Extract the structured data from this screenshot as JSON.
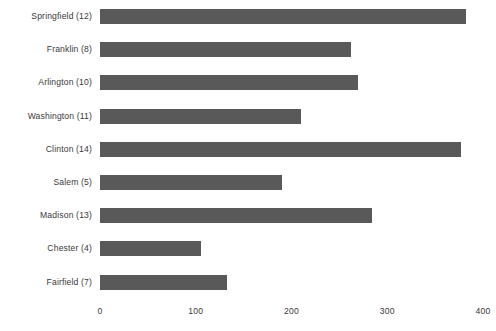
{
  "chart_data": {
    "type": "bar",
    "orientation": "horizontal",
    "title": "",
    "subtitle": "",
    "xlabel": "",
    "ylabel": "",
    "categories": [
      "Springfield (12)",
      "Franklin (8)",
      "Arlington (10)",
      "Washington (11)",
      "Clinton (14)",
      "Salem (5)",
      "Madison (13)",
      "Chester (4)",
      "Fairfield (7)"
    ],
    "values": [
      382,
      262,
      269,
      210,
      377,
      190,
      284,
      105,
      133
    ],
    "xlim": [
      0,
      400
    ],
    "x_ticks": [
      0,
      100,
      200,
      300,
      400
    ],
    "x_tick_labels": [
      "0",
      "100",
      "200",
      "300",
      "400"
    ],
    "grid": false,
    "legend": null,
    "bar_color": "#595959",
    "text_color": "#3a3a3a",
    "background_color": "#ffffff"
  }
}
